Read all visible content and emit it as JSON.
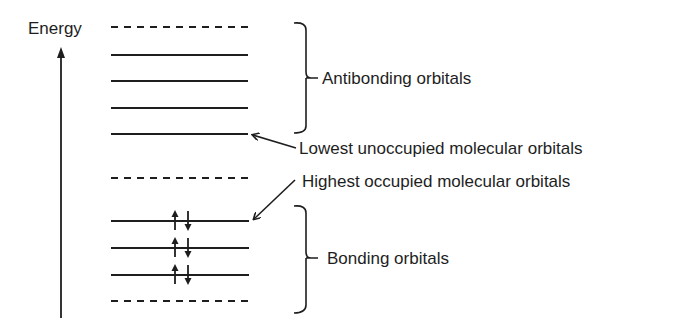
{
  "diagram": {
    "axis_label": "Energy",
    "labels": {
      "antibonding": "Antibonding orbitals",
      "lumo": "Lowest unoccupied molecular orbitals",
      "homo": "Highest occupied molecular orbitals",
      "bonding": "Bonding orbitals"
    },
    "levels": [
      {
        "y": 27,
        "style": "dashed",
        "group": "antibonding",
        "electrons": 0
      },
      {
        "y": 55,
        "style": "solid",
        "group": "antibonding",
        "electrons": 0
      },
      {
        "y": 81,
        "style": "solid",
        "group": "antibonding",
        "electrons": 0
      },
      {
        "y": 108,
        "style": "solid",
        "group": "antibonding",
        "electrons": 0
      },
      {
        "y": 134,
        "style": "solid",
        "group": "antibonding",
        "electrons": 0,
        "note": "LUMO"
      },
      {
        "y": 178,
        "style": "dashed",
        "group": "nonbonding",
        "electrons": 0
      },
      {
        "y": 221,
        "style": "solid",
        "group": "bonding",
        "electrons": 2,
        "note": "HOMO"
      },
      {
        "y": 248,
        "style": "solid",
        "group": "bonding",
        "electrons": 2
      },
      {
        "y": 275,
        "style": "solid",
        "group": "bonding",
        "electrons": 2
      },
      {
        "y": 301,
        "style": "dashed",
        "group": "bonding",
        "electrons": 0
      }
    ],
    "colors": {
      "ink": "#1e1e1e",
      "background": "#ffffff"
    }
  }
}
